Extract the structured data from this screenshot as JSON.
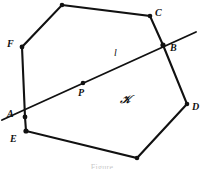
{
  "figure": {
    "caption": "Figure",
    "ink_color": "#111111",
    "background_color": "#ffffff",
    "polygon": {
      "name": "convex-polygon",
      "vertices": [
        {
          "id": "T",
          "label": "",
          "x": 62,
          "y": 5
        },
        {
          "id": "C",
          "label": "C",
          "x": 150,
          "y": 16
        },
        {
          "id": "B",
          "label": "B",
          "x": 163,
          "y": 45
        },
        {
          "id": "D",
          "label": "D",
          "x": 187,
          "y": 104
        },
        {
          "id": "S",
          "label": "",
          "x": 137,
          "y": 158
        },
        {
          "id": "E",
          "label": "E",
          "x": 26,
          "y": 131
        },
        {
          "id": "A",
          "label": "A",
          "x": 25,
          "y": 117
        },
        {
          "id": "F",
          "label": "F",
          "x": 22,
          "y": 47
        }
      ]
    },
    "line": {
      "id": "l",
      "label": "l",
      "x1": 2,
      "y1": 120,
      "x2": 196,
      "y2": 32
    },
    "points": [
      {
        "id": "P",
        "label": "P",
        "x": 83,
        "y": 83
      },
      {
        "id": "A",
        "label": "A",
        "x": 25,
        "y": 117
      },
      {
        "id": "B",
        "label": "B",
        "x": 163,
        "y": 45
      }
    ],
    "region": {
      "id": "K",
      "label": "𝒞̶",
      "glyph": "ℬ",
      "display": "𝒦",
      "x": 126,
      "y": 100
    },
    "labels": {
      "A": "A",
      "B": "B",
      "C": "C",
      "D": "D",
      "E": "E",
      "F": "F",
      "P": "P",
      "l": "l",
      "K": "𝒦"
    }
  }
}
